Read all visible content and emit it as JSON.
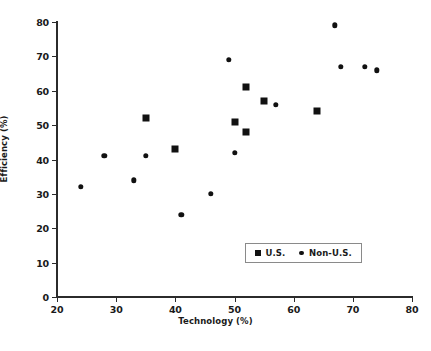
{
  "chart_data": {
    "type": "scatter",
    "title": "",
    "xlabel": "Technology (%)",
    "ylabel": "Efficiency (%)",
    "xlim": [
      20,
      80
    ],
    "ylim": [
      0,
      80
    ],
    "xticks": [
      20,
      30,
      40,
      50,
      60,
      70,
      80
    ],
    "yticks": [
      0,
      10,
      20,
      30,
      40,
      50,
      60,
      70,
      80
    ],
    "grid": false,
    "legend_position": "lower right",
    "marker_color": "#111111",
    "series": [
      {
        "name": "U.S.",
        "marker": "square",
        "points": [
          {
            "x": 35,
            "y": 52
          },
          {
            "x": 40,
            "y": 43
          },
          {
            "x": 50,
            "y": 51
          },
          {
            "x": 52,
            "y": 48
          },
          {
            "x": 52,
            "y": 61
          },
          {
            "x": 55,
            "y": 57
          },
          {
            "x": 64,
            "y": 54
          }
        ]
      },
      {
        "name": "Non-U.S.",
        "marker": "circle",
        "points": [
          {
            "x": 24,
            "y": 32
          },
          {
            "x": 28,
            "y": 41
          },
          {
            "x": 33,
            "y": 34
          },
          {
            "x": 35,
            "y": 41
          },
          {
            "x": 41,
            "y": 24
          },
          {
            "x": 46,
            "y": 30
          },
          {
            "x": 49,
            "y": 69
          },
          {
            "x": 50,
            "y": 42
          },
          {
            "x": 57,
            "y": 56
          },
          {
            "x": 67,
            "y": 79
          },
          {
            "x": 68,
            "y": 67
          },
          {
            "x": 72,
            "y": 67
          },
          {
            "x": 74,
            "y": 66
          }
        ]
      }
    ]
  },
  "legend": {
    "entries": [
      {
        "label": "U.S.",
        "marker": "square"
      },
      {
        "label": "Non-U.S.",
        "marker": "circle"
      }
    ]
  },
  "caption": ""
}
